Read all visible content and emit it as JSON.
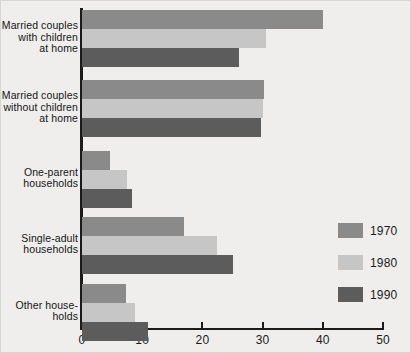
{
  "chart_data": {
    "type": "bar",
    "orientation": "horizontal",
    "title": "",
    "xlabel": "",
    "ylabel": "",
    "xlim": [
      0,
      50
    ],
    "xticks": [
      0,
      10,
      20,
      30,
      40,
      50
    ],
    "xtick_labels": [
      "0",
      "10",
      "20",
      "30",
      "40",
      "50"
    ],
    "grid": false,
    "legend_position": "right",
    "categories": [
      "Married couples\nwith children\nat home",
      "Married couples\nwithout children\nat home",
      "One-parent\nhouseholds",
      "Single-adult\nhouseholds",
      "Other house-\nholds"
    ],
    "series": [
      {
        "name": "1970",
        "color": "#8a8a8a",
        "values": [
          40.0,
          30.3,
          4.7,
          17.0,
          7.3
        ]
      },
      {
        "name": "1980",
        "color": "#c6c6c6",
        "values": [
          30.5,
          30.0,
          7.5,
          22.5,
          8.8
        ]
      },
      {
        "name": "1990",
        "color": "#5c5c5c",
        "values": [
          26.0,
          29.8,
          8.3,
          25.0,
          11.0
        ]
      }
    ]
  },
  "legend": {
    "items": [
      {
        "label": "1970",
        "color": "#8a8a8a"
      },
      {
        "label": "1980",
        "color": "#c6c6c6"
      },
      {
        "label": "1990",
        "color": "#5c5c5c"
      }
    ]
  },
  "axis": {
    "ticks": [
      "0",
      "10",
      "20",
      "30",
      "40",
      "50"
    ]
  }
}
